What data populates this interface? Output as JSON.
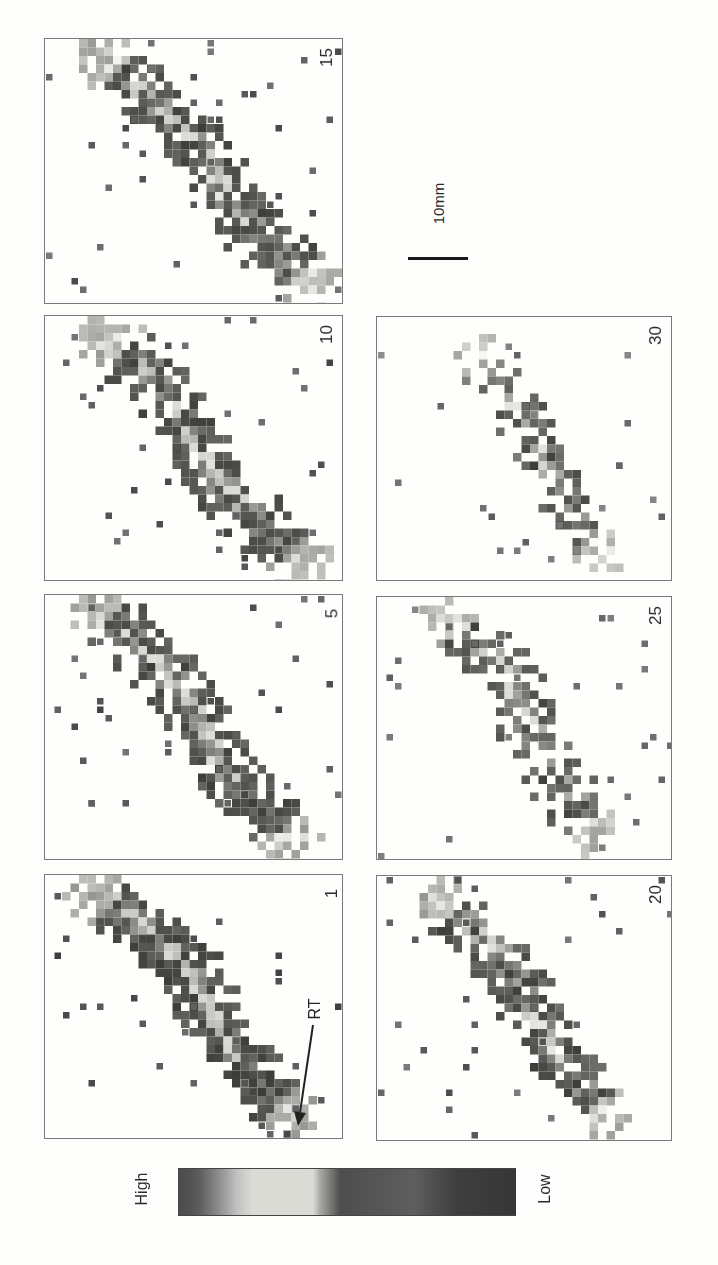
{
  "figure": {
    "scale_bar": {
      "label": "10mm"
    },
    "colorbar": {
      "high_label": "High",
      "low_label": "Low",
      "stops": [
        {
          "pos": 0.0,
          "color": "#4a4a4a"
        },
        {
          "pos": 0.06,
          "color": "#5a5a5a"
        },
        {
          "pos": 0.12,
          "color": "#8c8c8c"
        },
        {
          "pos": 0.17,
          "color": "#bdbdbd"
        },
        {
          "pos": 0.22,
          "color": "#dcdcd6"
        },
        {
          "pos": 0.4,
          "color": "#dadad4"
        },
        {
          "pos": 0.42,
          "color": "#a9a9a6"
        },
        {
          "pos": 0.48,
          "color": "#4d4d4d"
        },
        {
          "pos": 0.7,
          "color": "#5e5e5e"
        },
        {
          "pos": 0.82,
          "color": "#3f3f3f"
        },
        {
          "pos": 1.0,
          "color": "#363636"
        }
      ]
    },
    "annotation": {
      "label": "RT",
      "arrow_from": [
        313,
        1025
      ],
      "arrow_to": [
        298,
        1126
      ]
    },
    "panels": [
      {
        "id": "p15",
        "label": "15",
        "box": [
          44,
          38,
          299,
          266
        ],
        "seed": 15,
        "intensity": 0.85,
        "path": [
          [
            0.2,
            0.08
          ],
          [
            0.38,
            0.25
          ],
          [
            0.55,
            0.45
          ],
          [
            0.62,
            0.62
          ],
          [
            0.78,
            0.82
          ],
          [
            0.88,
            0.92
          ]
        ],
        "width": 0.08,
        "outliers": 40
      },
      {
        "id": "p10",
        "label": "10",
        "box": [
          44,
          315,
          299,
          266
        ],
        "seed": 10,
        "intensity": 0.9,
        "path": [
          [
            0.22,
            0.1
          ],
          [
            0.4,
            0.25
          ],
          [
            0.48,
            0.45
          ],
          [
            0.58,
            0.62
          ],
          [
            0.78,
            0.85
          ],
          [
            0.85,
            0.92
          ]
        ],
        "width": 0.08,
        "outliers": 32
      },
      {
        "id": "p5",
        "label": "5",
        "box": [
          44,
          594,
          299,
          266
        ],
        "seed": 5,
        "intensity": 0.9,
        "path": [
          [
            0.18,
            0.06
          ],
          [
            0.35,
            0.22
          ],
          [
            0.5,
            0.42
          ],
          [
            0.58,
            0.62
          ],
          [
            0.72,
            0.8
          ],
          [
            0.82,
            0.92
          ]
        ],
        "width": 0.08,
        "outliers": 38
      },
      {
        "id": "p1",
        "label": "1",
        "box": [
          44,
          874,
          299,
          265
        ],
        "seed": 1,
        "intensity": 1.0,
        "path": [
          [
            0.18,
            0.08
          ],
          [
            0.32,
            0.18
          ],
          [
            0.5,
            0.38
          ],
          [
            0.58,
            0.58
          ],
          [
            0.72,
            0.8
          ],
          [
            0.82,
            0.9
          ]
        ],
        "width": 0.08,
        "outliers": 30
      },
      {
        "id": "p30",
        "label": "30",
        "box": [
          376,
          316,
          296,
          265
        ],
        "seed": 30,
        "intensity": 0.6,
        "path": [
          [
            0.35,
            0.15
          ],
          [
            0.48,
            0.35
          ],
          [
            0.56,
            0.55
          ],
          [
            0.65,
            0.75
          ],
          [
            0.75,
            0.88
          ]
        ],
        "width": 0.07,
        "outliers": 22
      },
      {
        "id": "p25",
        "label": "25",
        "box": [
          376,
          596,
          296,
          264
        ],
        "seed": 25,
        "intensity": 0.7,
        "path": [
          [
            0.25,
            0.1
          ],
          [
            0.45,
            0.3
          ],
          [
            0.52,
            0.5
          ],
          [
            0.62,
            0.7
          ],
          [
            0.74,
            0.88
          ]
        ],
        "width": 0.08,
        "outliers": 30
      },
      {
        "id": "p20",
        "label": "20",
        "box": [
          376,
          875,
          296,
          266
        ],
        "seed": 20,
        "intensity": 0.78,
        "path": [
          [
            0.22,
            0.1
          ],
          [
            0.42,
            0.3
          ],
          [
            0.52,
            0.5
          ],
          [
            0.62,
            0.7
          ],
          [
            0.76,
            0.9
          ]
        ],
        "width": 0.08,
        "outliers": 32
      }
    ]
  }
}
